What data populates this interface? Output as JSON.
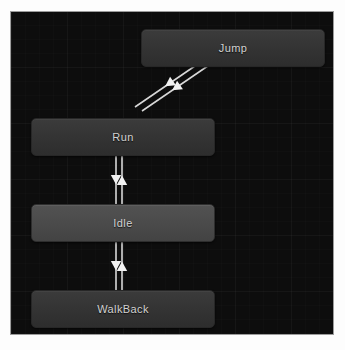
{
  "window": {
    "title": "Animator State Machine",
    "background_color": "#ffffff"
  },
  "canvas": {
    "background_color": "#0d0d0d",
    "border_color": "#9c9c9c",
    "x": 11,
    "y": 12,
    "width": 322,
    "height": 322
  },
  "graph": {
    "type": "state-machine",
    "edge_color": "#d8d8d8",
    "nodes": [
      {
        "id": "jump",
        "label": "Jump",
        "x": 130,
        "y": 17,
        "width": 184,
        "height": 38,
        "style": "normal",
        "fill": "#353535",
        "text_color": "#d2d2d2"
      },
      {
        "id": "run",
        "label": "Run",
        "x": 20,
        "y": 106,
        "width": 184,
        "height": 38,
        "style": "normal",
        "fill": "#353535",
        "text_color": "#d2d2d2"
      },
      {
        "id": "idle",
        "label": "Idle",
        "x": 20,
        "y": 192,
        "width": 184,
        "height": 38,
        "style": "default",
        "fill": "#4a4a4a",
        "text_color": "#d8d8d8"
      },
      {
        "id": "walkback",
        "label": "WalkBack",
        "x": 20,
        "y": 278,
        "width": 184,
        "height": 38,
        "style": "normal",
        "fill": "#353535",
        "text_color": "#d2d2d2"
      }
    ],
    "transitions": [
      {
        "id": "jump-to-run",
        "from": "jump",
        "to": "run",
        "direction": "down-left",
        "shape": "diagonal"
      },
      {
        "id": "run-to-jump",
        "from": "run",
        "to": "jump",
        "direction": "down-left",
        "shape": "diagonal"
      },
      {
        "id": "run-to-idle",
        "from": "run",
        "to": "idle",
        "direction": "down",
        "shape": "vertical"
      },
      {
        "id": "idle-to-run",
        "from": "idle",
        "to": "run",
        "direction": "up",
        "shape": "vertical"
      },
      {
        "id": "idle-to-walkback",
        "from": "idle",
        "to": "walkback",
        "direction": "down",
        "shape": "vertical"
      },
      {
        "id": "walkback-to-idle",
        "from": "walkback",
        "to": "idle",
        "direction": "up",
        "shape": "vertical"
      }
    ]
  }
}
